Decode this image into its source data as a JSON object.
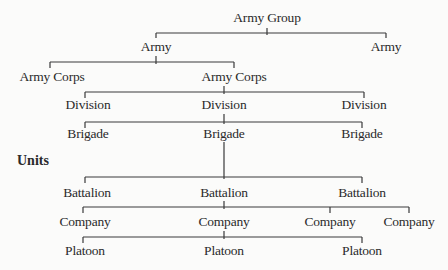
{
  "diagram": {
    "type": "hierarchy",
    "section_label": "Units",
    "levels": [
      {
        "level": "army_group",
        "nodes": [
          {
            "label": "Army Group",
            "x": 267,
            "y": 18
          }
        ]
      },
      {
        "level": "army",
        "nodes": [
          {
            "label": "Army",
            "x": 156,
            "y": 47
          },
          {
            "label": "Army",
            "x": 386,
            "y": 47
          }
        ]
      },
      {
        "level": "army_corps",
        "nodes": [
          {
            "label": "Army Corps",
            "x": 52,
            "y": 77
          },
          {
            "label": "Army Corps",
            "x": 234,
            "y": 77
          }
        ]
      },
      {
        "level": "division",
        "nodes": [
          {
            "label": "Division",
            "x": 88,
            "y": 105
          },
          {
            "label": "Division",
            "x": 224,
            "y": 105
          },
          {
            "label": "Division",
            "x": 364,
            "y": 105
          }
        ]
      },
      {
        "level": "brigade",
        "nodes": [
          {
            "label": "Brigade",
            "x": 88,
            "y": 134
          },
          {
            "label": "Brigade",
            "x": 224,
            "y": 134
          },
          {
            "label": "Brigade",
            "x": 362,
            "y": 134
          }
        ]
      },
      {
        "level": "battalion",
        "nodes": [
          {
            "label": "Battalion",
            "x": 87,
            "y": 193
          },
          {
            "label": "Battalion",
            "x": 224,
            "y": 193
          },
          {
            "label": "Battalion",
            "x": 362,
            "y": 193
          }
        ]
      },
      {
        "level": "company",
        "nodes": [
          {
            "label": "Company",
            "x": 85,
            "y": 222
          },
          {
            "label": "Company",
            "x": 224,
            "y": 222
          },
          {
            "label": "Company",
            "x": 330,
            "y": 222
          },
          {
            "label": "Company",
            "x": 409,
            "y": 222
          }
        ]
      },
      {
        "level": "platoon",
        "nodes": [
          {
            "label": "Platoon",
            "x": 85,
            "y": 251
          },
          {
            "label": "Platoon",
            "x": 224,
            "y": 251
          },
          {
            "label": "Platoon",
            "x": 362,
            "y": 251
          }
        ]
      }
    ],
    "connectors": [
      {
        "bar_y": 33,
        "x1": 156,
        "x2": 386,
        "parent_x": 267,
        "parent_top": 28,
        "child_xs": [
          156,
          386
        ],
        "drop": 5
      },
      {
        "bar_y": 62,
        "x1": 50,
        "x2": 234,
        "parent_x": 156,
        "parent_top": 56,
        "child_xs": [
          50,
          234
        ],
        "drop": 6
      },
      {
        "bar_y": 92,
        "x1": 85,
        "x2": 364,
        "parent_x": 224,
        "parent_top": 86,
        "child_xs": [
          85,
          364
        ],
        "drop": 6
      },
      {
        "bar_y": 122,
        "x1": 85,
        "x2": 362,
        "parent_x": 224,
        "parent_top": 114,
        "child_xs": [
          85,
          362
        ],
        "drop": 6
      },
      {
        "bar_y": 177,
        "x1": 85,
        "x2": 362,
        "parent_x": 224,
        "parent_top": 142,
        "child_xs": [
          85,
          362
        ],
        "drop": 6
      },
      {
        "bar_y": 207,
        "x1": 83,
        "x2": 409,
        "parent_x": 224,
        "parent_top": 201,
        "child_xs": [
          83,
          330,
          409
        ],
        "drop": 6
      },
      {
        "bar_y": 237,
        "x1": 83,
        "x2": 362,
        "parent_x": 224,
        "parent_top": 231,
        "child_xs": [
          83,
          362
        ],
        "drop": 6
      }
    ]
  }
}
